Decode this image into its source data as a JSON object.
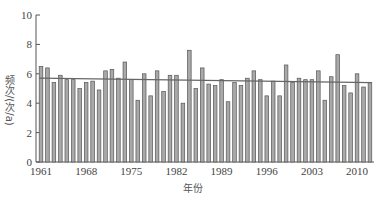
{
  "chart_data": {
    "type": "bar",
    "title": "",
    "xlabel": "年份",
    "ylabel": "频次/(次/a)",
    "ylim": [
      0,
      10
    ],
    "yticks": [
      0,
      2,
      4,
      6,
      8,
      10
    ],
    "xtick_labels": [
      "1961",
      "1968",
      "1975",
      "1982",
      "1989",
      "1996",
      "2003",
      "2010"
    ],
    "grid": false,
    "legend": null,
    "categories": [
      1961,
      1962,
      1963,
      1964,
      1965,
      1966,
      1967,
      1968,
      1969,
      1970,
      1971,
      1972,
      1973,
      1974,
      1975,
      1976,
      1977,
      1978,
      1979,
      1980,
      1981,
      1982,
      1983,
      1984,
      1985,
      1986,
      1987,
      1988,
      1989,
      1990,
      1991,
      1992,
      1993,
      1994,
      1995,
      1996,
      1997,
      1998,
      1999,
      2000,
      2001,
      2002,
      2003,
      2004,
      2005,
      2006,
      2007,
      2008,
      2009,
      2010,
      2011,
      2012
    ],
    "series": [
      {
        "name": "频次",
        "values": [
          6.5,
          6.4,
          5.4,
          5.9,
          5.6,
          5.6,
          5.0,
          5.4,
          5.5,
          4.9,
          6.2,
          6.3,
          5.7,
          6.8,
          5.6,
          4.2,
          6.0,
          4.5,
          6.2,
          4.8,
          5.9,
          5.9,
          4.0,
          7.6,
          5.0,
          6.4,
          5.3,
          5.2,
          5.6,
          4.1,
          5.4,
          5.2,
          5.7,
          6.2,
          5.6,
          4.5,
          5.5,
          4.5,
          6.6,
          5.4,
          5.7,
          5.6,
          5.6,
          6.2,
          4.2,
          5.8,
          7.3,
          5.2,
          4.7,
          6.0,
          5.1,
          5.4
        ]
      },
      {
        "name": "线性趋势",
        "type": "line",
        "start": [
          1961,
          5.7
        ],
        "end": [
          2012,
          5.4
        ]
      }
    ]
  }
}
